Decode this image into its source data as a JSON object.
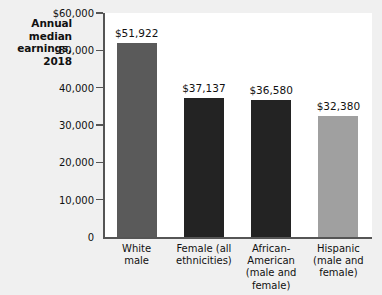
{
  "title": {
    "line1": "Annual",
    "line2": "median",
    "line3": "earnings,",
    "line4": "2018"
  },
  "axis": {
    "y_tick_labels": [
      "$60,000",
      "50,000",
      "40,000",
      "30,000",
      "20,000",
      "10,000",
      "0"
    ],
    "y_max": 60000,
    "y_min": 0,
    "y_step": 10000
  },
  "bars": [
    {
      "label_line1": "White",
      "label_line2": "male",
      "label_line3": "",
      "label_line4": "",
      "value_label": "$51,922",
      "value": 51922,
      "color": "#5a5a5a"
    },
    {
      "label_line1": "Female (all",
      "label_line2": "ethnicities)",
      "label_line3": "",
      "label_line4": "",
      "value_label": "$37,137",
      "value": 37137,
      "color": "#232323"
    },
    {
      "label_line1": "African-",
      "label_line2": "American",
      "label_line3": "(male and",
      "label_line4": "female)",
      "value_label": "$36,580",
      "value": 36580,
      "color": "#232323"
    },
    {
      "label_line1": "Hispanic",
      "label_line2": "(male and",
      "label_line3": "female)",
      "label_line4": "",
      "value_label": "$32,380",
      "value": 32380,
      "color": "#a0a0a0"
    }
  ],
  "chart_data": {
    "type": "bar",
    "title": "Annual median earnings, 2018",
    "xlabel": "",
    "ylabel": "Annual median earnings, 2018",
    "ylim": [
      0,
      60000
    ],
    "ytick_step": 10000,
    "ytick_labels": [
      "$60,000",
      "50,000",
      "40,000",
      "30,000",
      "20,000",
      "10,000",
      "0"
    ],
    "grid": false,
    "legend": "none",
    "categories": [
      "White male",
      "Female (all ethnicities)",
      "African-American (male and female)",
      "Hispanic (male and female)"
    ],
    "values": [
      51922,
      37137,
      36580,
      32380
    ],
    "data_labels": [
      "$51,922",
      "$37,137",
      "$36,580",
      "$32,380"
    ],
    "bar_colors": [
      "#5a5a5a",
      "#232323",
      "#232323",
      "#a0a0a0"
    ],
    "background": "#ffffff",
    "figure_background": "#f0f0f0"
  }
}
